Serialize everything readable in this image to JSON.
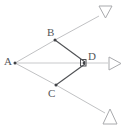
{
  "figure": {
    "kind": "geometry-diagram",
    "background_color": "#ffffff",
    "stroke_color_light": "#b9babc",
    "stroke_color_dark": "#4f5154",
    "label_color": "#55575a",
    "points": [
      {
        "id": "A",
        "label": "A",
        "x": 15,
        "y": 63,
        "label_x": 5,
        "label_y": 57,
        "dot": true
      },
      {
        "id": "B",
        "label": "B",
        "x": 55,
        "y": 40,
        "label_x": 47,
        "label_y": 27,
        "dot": true
      },
      {
        "id": "C",
        "label": "C",
        "x": 56,
        "y": 85,
        "label_x": 48,
        "label_y": 88,
        "dot": true
      },
      {
        "id": "D",
        "label": "D",
        "x": 85,
        "y": 63,
        "label_x": 89,
        "label_y": 52,
        "dot": true
      }
    ],
    "segments": [
      {
        "name": "segment-A-B",
        "from": "A",
        "to": "B",
        "tone": "light"
      },
      {
        "name": "segment-A-C",
        "from": "A",
        "to": "C",
        "tone": "light"
      },
      {
        "name": "segment-A-D",
        "from": "A",
        "to": "D",
        "tone": "light"
      },
      {
        "name": "segment-B-D",
        "from": "B",
        "to": "D",
        "tone": "dark"
      },
      {
        "name": "segment-C-D",
        "from": "C",
        "to": "D",
        "tone": "dark"
      }
    ],
    "rays": [
      {
        "name": "ray-A-through-B",
        "through": "B",
        "x1": 55,
        "y1": 40,
        "x2": 99,
        "y2": 16,
        "tone": "light"
      },
      {
        "name": "ray-A-through-D",
        "through": "D",
        "x1": 85,
        "y1": 63,
        "x2": 107,
        "y2": 63,
        "tone": "light"
      },
      {
        "name": "ray-A-through-C",
        "through": "C",
        "x1": 56,
        "y1": 85,
        "x2": 104,
        "y2": 113,
        "tone": "light"
      }
    ],
    "arrowheads": [
      {
        "name": "arrowhead-upper-right",
        "direction": "down",
        "cx": 105,
        "cy": 12,
        "size": 11
      },
      {
        "name": "arrowhead-right",
        "direction": "right",
        "cx": 114,
        "cy": 63,
        "size": 11
      },
      {
        "name": "arrowhead-lower-right",
        "direction": "up",
        "cx": 110,
        "cy": 119,
        "size": 11
      }
    ],
    "right_angle_mark": {
      "name": "right-angle-mark-at-D",
      "vertex": "D",
      "x": 80,
      "y": 59,
      "size": 6
    }
  }
}
